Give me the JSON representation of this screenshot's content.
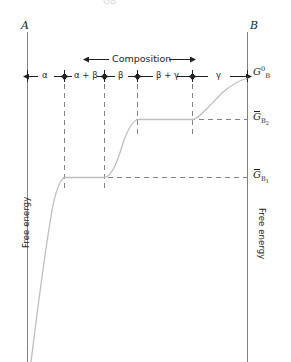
{
  "figure": {
    "top_clipped_caption": "ḠB",
    "left_axis_title": "Free energy",
    "right_axis_title": "Free energy",
    "left_endpoint_label": "A",
    "right_endpoint_label": "B",
    "composition_label": "Composition"
  },
  "phase_fields": [
    {
      "name": "alpha",
      "label": "α"
    },
    {
      "name": "alpha-beta",
      "label": "α + β"
    },
    {
      "name": "beta",
      "label": "β"
    },
    {
      "name": "beta-gamma",
      "label": "β + γ"
    },
    {
      "name": "gamma",
      "label": "γ"
    }
  ],
  "energy_levels": [
    {
      "name": "g-b-standard",
      "symbol": "G",
      "sup": "0",
      "sub": "B",
      "overbar": false
    },
    {
      "name": "g-b-2",
      "symbol": "G",
      "sup": "",
      "sub": "B2",
      "overbar": true
    },
    {
      "name": "g-b-1",
      "symbol": "G",
      "sup": "",
      "sub": "B1",
      "overbar": true
    }
  ],
  "chart_data": {
    "type": "line",
    "title": "",
    "xlabel": "Composition",
    "ylabel": "Free energy",
    "xlim": [
      0,
      1
    ],
    "ylim": [
      0,
      1
    ],
    "grid": false,
    "legend_position": "none",
    "x_endpoints": [
      "A",
      "B"
    ],
    "phase_boundaries_x": [
      0.0,
      0.167,
      0.348,
      0.498,
      0.747,
      1.0
    ],
    "phase_field_labels": [
      "α",
      "α + β",
      "β",
      "β + γ",
      "γ"
    ],
    "horizontal_reference_lines": [
      {
        "label": "Ḡ_B1",
        "y_px": 177,
        "from_x_px": 64,
        "to_x_px": 248
      },
      {
        "label": "Ḡ_B2",
        "y_px": 119,
        "from_x_px": 137,
        "to_x_px": 248
      }
    ],
    "vertical_boundary_lines_x_px": [
      64,
      104,
      137,
      192
    ],
    "curve_points_px": [
      [
        31,
        362
      ],
      [
        38,
        300
      ],
      [
        48,
        236
      ],
      [
        58,
        190
      ],
      [
        64,
        177
      ],
      [
        75,
        177
      ],
      [
        90,
        177
      ],
      [
        104,
        177
      ],
      [
        110,
        168
      ],
      [
        117,
        150
      ],
      [
        124,
        134
      ],
      [
        131,
        124
      ],
      [
        137,
        119
      ],
      [
        155,
        119
      ],
      [
        175,
        119
      ],
      [
        192,
        119
      ],
      [
        200,
        112
      ],
      [
        212,
        100
      ],
      [
        226,
        89
      ],
      [
        238,
        82
      ],
      [
        248,
        78
      ]
    ],
    "series": [
      {
        "name": "partial molar free energy of B",
        "description": "Free energy of component B across the A-B composition axis: steep rise through single-phase alpha, plateau at G-bar-B1 across alpha+beta, rise through beta, plateau at G-bar-B2 across beta+gamma, rise through gamma to G-zero-B at pure B"
      }
    ]
  }
}
